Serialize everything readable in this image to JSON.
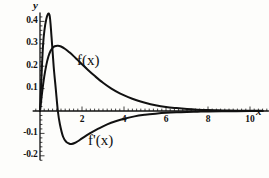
{
  "chart_data": {
    "type": "line",
    "title": "",
    "xlabel": "x",
    "ylabel": "y",
    "xlim": [
      -0.35,
      10.9
    ],
    "ylim": [
      -0.22,
      0.44
    ],
    "grid": false,
    "legend": "inline-annotations",
    "x_ticks": [
      2,
      4,
      6,
      8,
      10
    ],
    "x_tick_labels": [
      "2",
      "4",
      "6",
      "8",
      "10"
    ],
    "x_minor_tick_step": 0.2,
    "y_ticks": [
      0.4,
      0.3,
      0.2,
      0.1,
      -0.1,
      -0.2
    ],
    "y_tick_labels": [
      "0.4",
      "0.3",
      "0.2",
      "0.1",
      "-0.1",
      "-0.2"
    ],
    "y_minor_tick_step": 0.02,
    "series": [
      {
        "name": "f(x)",
        "annotation": "f(x)",
        "color": "#111111",
        "x": [
          0,
          0.1,
          0.2,
          0.3,
          0.4,
          0.5,
          0.6,
          0.7,
          0.85,
          1.0,
          1.2,
          1.4,
          1.6,
          1.8,
          2.0,
          2.3,
          2.6,
          3.0,
          3.4,
          3.8,
          4.2,
          4.6,
          5.0,
          5.5,
          6.0,
          6.5,
          7.0,
          7.5,
          8.0,
          8.5,
          9.0,
          9.5,
          10.0,
          10.6
        ],
        "y": [
          0.0,
          0.082,
          0.152,
          0.205,
          0.243,
          0.268,
          0.282,
          0.289,
          0.291,
          0.288,
          0.277,
          0.262,
          0.245,
          0.227,
          0.209,
          0.182,
          0.157,
          0.126,
          0.1,
          0.079,
          0.062,
          0.048,
          0.037,
          0.026,
          0.018,
          0.013,
          0.009,
          0.006,
          0.004,
          0.003,
          0.002,
          0.0015,
          0.001,
          0.0006
        ]
      },
      {
        "name": "f'(x)",
        "annotation": "f'(x)",
        "color": "#111111",
        "x": [
          0,
          0.15,
          0.3,
          0.45,
          0.55,
          0.65,
          0.75,
          0.85,
          0.95,
          1.1,
          1.25,
          1.4,
          1.5,
          1.65,
          1.8,
          2.0,
          2.2,
          2.5,
          2.8,
          3.2,
          3.6,
          4.0,
          4.5,
          5.0,
          5.5,
          6.0,
          6.5,
          7.0,
          7.5,
          8.0,
          9.0,
          10.0,
          10.6
        ],
        "y": [
          0.0,
          0.3,
          0.41,
          0.43,
          0.33,
          0.2,
          0.1,
          0.0,
          -0.06,
          -0.115,
          -0.138,
          -0.146,
          -0.147,
          -0.143,
          -0.135,
          -0.122,
          -0.11,
          -0.093,
          -0.078,
          -0.06,
          -0.046,
          -0.035,
          -0.024,
          -0.017,
          -0.012,
          -0.008,
          -0.0055,
          -0.004,
          -0.003,
          -0.002,
          -0.001,
          -0.0005,
          -0.0003
        ]
      }
    ]
  },
  "axes": {
    "y_axis_name": "y",
    "x_axis_name": "x"
  }
}
